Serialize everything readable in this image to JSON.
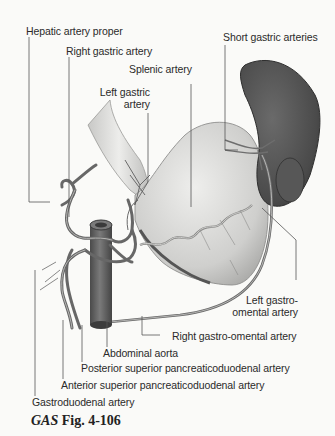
{
  "figure": {
    "caption_prefix": "GAS",
    "caption_suffix": "Fig. 4-106",
    "background": "#fafaf8",
    "artery_color": "#6e6e6e",
    "spleen_color": "#5a5a5a",
    "stomach_color": "#d8d8d6",
    "aorta_color": "#606060"
  },
  "labels": {
    "hepatic_artery_proper": "Hepatic artery proper",
    "right_gastric_artery": "Right gastric artery",
    "splenic_artery": "Splenic artery",
    "left_gastric_artery_line1": "Left gastric",
    "left_gastric_artery_line2": "artery",
    "short_gastric_arteries": "Short gastric arteries",
    "left_gastro_omental_line1": "Left gastro-",
    "left_gastro_omental_line2": "omental artery",
    "right_gastro_omental": "Right gastro-omental artery",
    "abdominal_aorta": "Abdominal aorta",
    "posterior_superior_pd": "Posterior superior pancreaticoduodenal artery",
    "anterior_superior_pd": "Anterior superior pancreaticoduodenal artery",
    "gastroduodenal": "Gastroduodenal artery"
  }
}
